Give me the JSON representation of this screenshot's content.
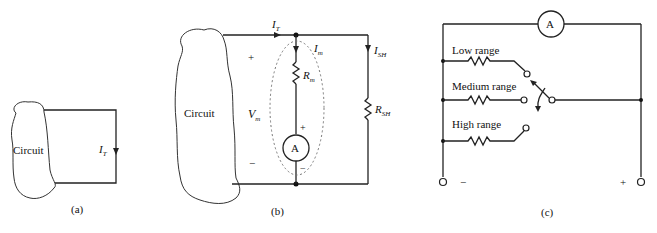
{
  "figure": {
    "panels": [
      {
        "id": "a",
        "caption": "(a)",
        "circuit_label": "Circuit",
        "current_label": "I",
        "current_sub": "T"
      },
      {
        "id": "b",
        "caption": "(b)",
        "circuit_label": "Circuit",
        "total_current": {
          "label": "I",
          "sub": "T"
        },
        "meter_current": {
          "label": "I",
          "sub": "m"
        },
        "shunt_current": {
          "label": "I",
          "sub": "SH"
        },
        "meter_resistor": {
          "label": "R",
          "sub": "m"
        },
        "shunt_resistor": {
          "label": "R",
          "sub": "SH"
        },
        "meter_voltage": {
          "label": "V",
          "sub": "m"
        },
        "ammeter_symbol": "A",
        "plus": "+",
        "minus": "−",
        "meter_plus": "+",
        "meter_minus": "−"
      },
      {
        "id": "c",
        "caption": "(c)",
        "ammeter_symbol": "A",
        "ranges": [
          "Low range",
          "Medium range",
          "High range"
        ],
        "terminal_minus": "−",
        "terminal_plus": "+"
      }
    ]
  }
}
